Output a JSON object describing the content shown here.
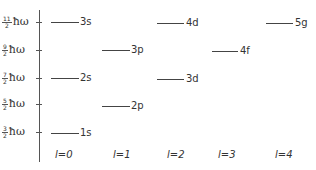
{
  "y_axis": {
    "labels": [
      {
        "num": "11",
        "den": "2",
        "unit": "ħω",
        "y": 22
      },
      {
        "num": "9",
        "den": "2",
        "unit": "ħω",
        "y": 50
      },
      {
        "num": "7",
        "den": "2",
        "unit": "ħω",
        "y": 78
      },
      {
        "num": "5",
        "den": "2",
        "unit": "ħω",
        "y": 104
      },
      {
        "num": "3",
        "den": "2",
        "unit": "ħω",
        "y": 132
      }
    ]
  },
  "x_axis": {
    "labels": [
      "l=0",
      "l=1",
      "l=2",
      "l=3",
      "l=4"
    ]
  },
  "levels": [
    {
      "label": "3s",
      "l": 0,
      "energy": "11/2"
    },
    {
      "label": "2s",
      "l": 0,
      "energy": "7/2"
    },
    {
      "label": "1s",
      "l": 0,
      "energy": "3/2"
    },
    {
      "label": "3p",
      "l": 1,
      "energy": "9/2"
    },
    {
      "label": "2p",
      "l": 1,
      "energy": "5/2"
    },
    {
      "label": "4d",
      "l": 2,
      "energy": "11/2"
    },
    {
      "label": "3d",
      "l": 2,
      "energy": "7/2"
    },
    {
      "label": "4f",
      "l": 3,
      "energy": "9/2"
    },
    {
      "label": "5g",
      "l": 4,
      "energy": "11/2"
    }
  ]
}
